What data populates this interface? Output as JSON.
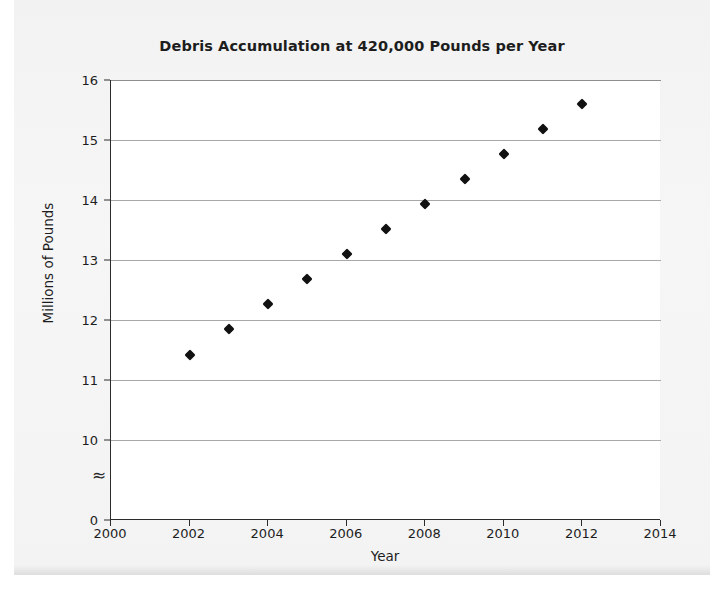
{
  "chart_data": {
    "type": "scatter",
    "title": "Debris Accumulation at 420,000 Pounds per Year",
    "xlabel": "Year",
    "ylabel": "Millions of Pounds",
    "x": [
      2002,
      2003,
      2004,
      2005,
      2006,
      2007,
      2008,
      2009,
      2010,
      2011,
      2012
    ],
    "values": [
      11.42,
      11.85,
      12.27,
      12.68,
      13.1,
      13.52,
      13.93,
      14.35,
      14.77,
      15.19,
      15.6
    ],
    "series": [
      {
        "name": "Debris Accumulation",
        "values": [
          11.42,
          11.85,
          12.27,
          12.68,
          13.1,
          13.52,
          13.93,
          14.35,
          14.77,
          15.19,
          15.6
        ]
      }
    ],
    "xlim": [
      2000,
      2014
    ],
    "xticks": [
      2000,
      2002,
      2004,
      2006,
      2008,
      2010,
      2012,
      2014
    ],
    "xtick_labels": [
      "2000",
      "2002",
      "2004",
      "2006",
      "2008",
      "2010",
      "2012",
      "2014"
    ],
    "ylim": [
      10,
      16
    ],
    "yticks": [
      10,
      11,
      12,
      13,
      14,
      15,
      16
    ],
    "ytick_labels": [
      "10",
      "11",
      "12",
      "13",
      "14",
      "15",
      "16"
    ],
    "y_origin_label": "0",
    "y_axis_break": "≈",
    "y_axis_broken": true,
    "grid": "horizontal",
    "legend": "none",
    "marker_shape": "diamond",
    "marker_color": "#111111"
  },
  "colors": {
    "page_background": "#f4f4f4",
    "plot_background": "#ffffff",
    "axis": "#2c2c2c",
    "gridline": "#a8a8a8",
    "text": "#1d1d1d",
    "marker": "#111111"
  }
}
